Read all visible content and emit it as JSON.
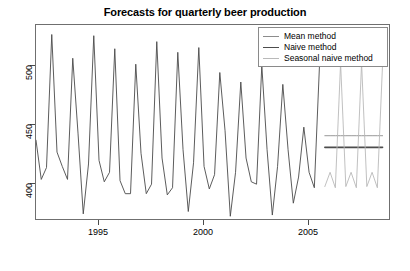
{
  "chart_data": {
    "type": "line",
    "title": "Forecasts for quarterly beer production",
    "xlabel": "",
    "ylabel": "",
    "xlim": [
      1992.0,
      2008.9
    ],
    "ylim": [
      375,
      540
    ],
    "xticks": [
      1995,
      2000,
      2005
    ],
    "xticklabels": [
      "1995",
      "2000",
      "2005"
    ],
    "yticks": [
      400,
      450,
      500
    ],
    "yticklabels": [
      "400",
      "450",
      "500"
    ],
    "grid": false,
    "legend_position": "top-right",
    "legend": [
      {
        "label": "Mean method",
        "color": "#7f7f7f"
      },
      {
        "label": "Naive method",
        "color": "#4d4d4d"
      },
      {
        "label": "Seasonal naive method",
        "color": "#b4b4b4"
      }
    ],
    "series": [
      {
        "name": "Historical quarterly beer production",
        "color": "#4a4a4a",
        "x": [
          1992.0,
          1992.25,
          1992.5,
          1992.75,
          1993.0,
          1993.25,
          1993.5,
          1993.75,
          1994.0,
          1994.25,
          1994.5,
          1994.75,
          1995.0,
          1995.25,
          1995.5,
          1995.75,
          1996.0,
          1996.25,
          1996.5,
          1996.75,
          1997.0,
          1997.25,
          1997.5,
          1997.75,
          1998.0,
          1998.25,
          1998.5,
          1998.75,
          1999.0,
          1999.25,
          1999.5,
          1999.75,
          2000.0,
          2000.25,
          2000.5,
          2000.75,
          2001.0,
          2001.25,
          2001.5,
          2001.75,
          2002.0,
          2002.25,
          2002.5,
          2002.75,
          2003.0,
          2003.25,
          2003.5,
          2003.75,
          2004.0,
          2004.25,
          2004.5,
          2004.75,
          2005.0,
          2005.25,
          2005.5
        ],
        "y": [
          443,
          410,
          420,
          532,
          433,
          421,
          410,
          512,
          449,
          381,
          423,
          531,
          426,
          408,
          416,
          520,
          409,
          398,
          398,
          507,
          432,
          398,
          406,
          526,
          428,
          397,
          403,
          517,
          435,
          383,
          424,
          521,
          421,
          402,
          414,
          500,
          451,
          379,
          416,
          492,
          428,
          408,
          406,
          506,
          435,
          380,
          421,
          490,
          435,
          390,
          412,
          454,
          416,
          403,
          508
        ]
      },
      {
        "name": "Mean method",
        "color": "#8c8c8c",
        "x": [
          2005.75,
          2006.0,
          2006.25,
          2006.5,
          2006.75,
          2007.0,
          2007.25,
          2007.5,
          2007.75,
          2008.0,
          2008.25,
          2008.5
        ],
        "y": [
          446.8,
          446.8,
          446.8,
          446.8,
          446.8,
          446.8,
          446.8,
          446.8,
          446.8,
          446.8,
          446.8,
          446.8
        ]
      },
      {
        "name": "Naive method",
        "color": "#4d4d4d",
        "x": [
          2005.75,
          2006.0,
          2006.25,
          2006.5,
          2006.75,
          2007.0,
          2007.25,
          2007.5,
          2007.75,
          2008.0,
          2008.25,
          2008.5
        ],
        "y": [
          437,
          437,
          437,
          437,
          437,
          437,
          437,
          437,
          437,
          437,
          437,
          437
        ]
      },
      {
        "name": "Seasonal naive method",
        "color": "#b9b9b9",
        "x": [
          2005.75,
          2006.0,
          2006.25,
          2006.5,
          2006.75,
          2007.0,
          2007.25,
          2007.5,
          2007.75,
          2008.0,
          2008.25,
          2008.5
        ],
        "y": [
          404,
          416,
          403,
          508,
          404,
          416,
          403,
          508,
          404,
          416,
          403,
          508
        ]
      }
    ]
  },
  "axes": {
    "y_tick_labels": [
      "500",
      "450",
      "400"
    ],
    "x_tick_labels": [
      "1995",
      "2000",
      "2005"
    ]
  },
  "legend": {
    "items": [
      {
        "label": "Mean method"
      },
      {
        "label": "Naive method"
      },
      {
        "label": "Seasonal naive method"
      }
    ]
  },
  "title": {
    "text": "Forecasts for quarterly beer production"
  }
}
